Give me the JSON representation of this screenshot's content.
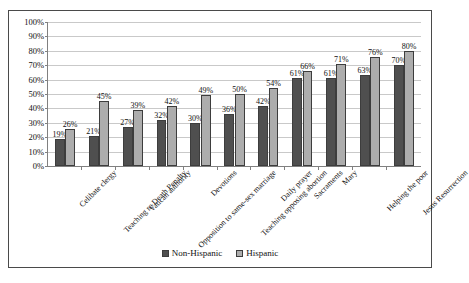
{
  "chart_data": {
    "type": "bar",
    "title": "",
    "xlabel": "",
    "ylabel": "",
    "ylim": [
      0,
      100
    ],
    "yticks": [
      "0%",
      "10%",
      "20%",
      "30%",
      "40%",
      "50%",
      "60%",
      "70%",
      "80%",
      "90%",
      "100%"
    ],
    "grid": true,
    "legend_position": "bottom",
    "categories": [
      "Celibate clergy",
      "Teaching re Death Penalty",
      "Vatican authority",
      "Opposition to same-sex marriage",
      "Devotions",
      "Teaching opposing abortion",
      "Daily prayer",
      "Sacraments",
      "Mary",
      "Helping the poor",
      "Jesus Resurrection"
    ],
    "series": [
      {
        "name": "Non-Hispanic",
        "color": "#4f4f4f",
        "values": [
          19,
          21,
          27,
          32,
          30,
          36,
          42,
          61,
          61,
          63,
          70
        ],
        "labels": [
          "19%",
          "21%",
          "27%",
          "32%",
          "30%",
          "36%",
          "42%",
          "61%",
          "61%",
          "63%",
          "70%"
        ]
      },
      {
        "name": "Hispanic",
        "color": "#adadad",
        "values": [
          26,
          45,
          39,
          42,
          49,
          50,
          54,
          66,
          71,
          76,
          80
        ],
        "labels": [
          "26%",
          "45%",
          "39%",
          "42%",
          "49%",
          "50%",
          "54%",
          "66%",
          "71%",
          "76%",
          "80%"
        ]
      }
    ]
  }
}
